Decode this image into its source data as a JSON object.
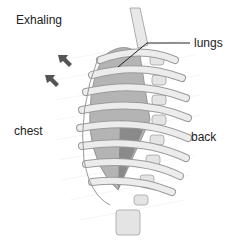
{
  "diagram": {
    "title": "Exhaling",
    "labels": {
      "lungs": "lungs",
      "chest": "chest",
      "back": "back"
    },
    "icons": [
      "arrow-inward-icon",
      "arrow-inward-icon"
    ],
    "colors": {
      "bone": "#e6e6e6",
      "bone_outline": "#9a9a9a",
      "lung": "#a8a8a8",
      "lung_dark": "#7c7c7c",
      "arrow": "#555555",
      "text": "#222222"
    }
  }
}
